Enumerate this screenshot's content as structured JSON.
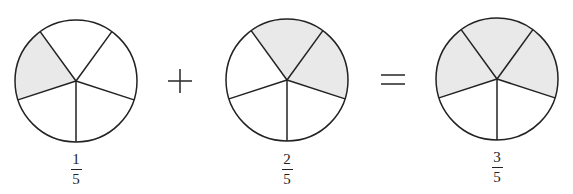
{
  "colors": {
    "shade": "#e9e9e9",
    "stroke": "#222222",
    "background": "#ffffff"
  },
  "operators": {
    "plus": "+",
    "equals": "="
  },
  "pies": [
    {
      "id": "pie-1",
      "cx": 76,
      "cy": 81,
      "r": 61,
      "slices": 5,
      "shaded": [
        1
      ],
      "fraction": {
        "numerator": "1",
        "denominator": "5"
      },
      "label_x": 61
    },
    {
      "id": "pie-2",
      "cx": 287,
      "cy": 80,
      "r": 61,
      "slices": 5,
      "shaded": [
        2,
        3
      ],
      "fraction": {
        "numerator": "2",
        "denominator": "5"
      },
      "label_x": 272
    },
    {
      "id": "pie-3",
      "cx": 497,
      "cy": 79,
      "r": 61,
      "slices": 5,
      "shaded": [
        1,
        2,
        3
      ],
      "fraction": {
        "numerator": "3",
        "denominator": "5"
      },
      "label_x": 482
    }
  ]
}
